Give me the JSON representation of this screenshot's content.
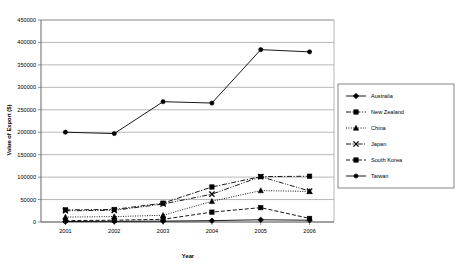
{
  "chart_data": {
    "type": "line",
    "title": "",
    "xlabel": "Year",
    "ylabel": "Value of Export ($)",
    "categories": [
      "2001",
      "2002",
      "2003",
      "2004",
      "2005",
      "2006"
    ],
    "x_tick_labels": [
      "2001",
      "2002",
      "2003",
      "2004",
      "2005",
      "2006"
    ],
    "y_tick_labels": [
      "0",
      "50000",
      "100000",
      "150000",
      "200000",
      "250000",
      "300000",
      "350000",
      "400000",
      "450000"
    ],
    "y_ticks": [
      0,
      50000,
      100000,
      150000,
      200000,
      250000,
      300000,
      350000,
      400000,
      450000
    ],
    "ylim": [
      0,
      450000
    ],
    "grid": "horizontal",
    "legend_position": "right",
    "series": [
      {
        "name": "Australia",
        "marker": "diamond",
        "dash": "solid",
        "values": [
          1000,
          1500,
          2000,
          3000,
          5000,
          4000
        ]
      },
      {
        "name": "New Zealand",
        "marker": "square",
        "dash": "dashdot",
        "values": [
          27000,
          28000,
          42000,
          78000,
          101000,
          102000
        ]
      },
      {
        "name": "China",
        "marker": "triangle",
        "dash": "dotted",
        "values": [
          11000,
          12000,
          15000,
          46000,
          70000,
          68000
        ]
      },
      {
        "name": "Japan",
        "marker": "cross",
        "dash": "dashdotdot",
        "values": [
          25000,
          26000,
          40000,
          62000,
          101000,
          69000
        ]
      },
      {
        "name": "South Korea",
        "marker": "square",
        "dash": "dashed",
        "values": [
          3000,
          4000,
          6000,
          22000,
          32000,
          8000
        ]
      },
      {
        "name": "Taiwan",
        "marker": "circle",
        "dash": "solid",
        "values": [
          200000,
          197000,
          268000,
          265000,
          384000,
          379000
        ]
      }
    ]
  },
  "legend": {
    "entries": [
      "Australia",
      "New Zealand",
      "China",
      "Japan",
      "South Korea",
      "Taiwan"
    ]
  }
}
